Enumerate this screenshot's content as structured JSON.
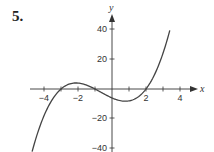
{
  "problem": {
    "number": "5."
  },
  "chart_data": {
    "type": "line",
    "title": "",
    "xlabel": "x",
    "ylabel": "y",
    "xlim": [
      -4.8,
      4.8
    ],
    "ylim": [
      -40,
      45
    ],
    "grid": false,
    "x_ticks": [
      -4,
      -3,
      -2,
      -1,
      1,
      2,
      3,
      4
    ],
    "x_tick_labels": [
      "-4",
      "-2",
      "2",
      "4"
    ],
    "y_ticks": [
      -40,
      -20,
      20,
      40
    ],
    "y_tick_labels": [
      "40",
      "20",
      "-20",
      "-40"
    ],
    "series": [
      {
        "name": "f(x)",
        "expression": "(x+3)(x+1)(x-2)",
        "x": [
          -4.7,
          -4.5,
          -4,
          -3.5,
          -3,
          -2.5,
          -2,
          -1.5,
          -1,
          -0.5,
          0,
          0.5,
          1,
          1.5,
          2,
          2.5,
          3,
          3.4
        ],
        "values": [
          -38.6,
          -31.5,
          -18,
          -8.1,
          0,
          3.4,
          4,
          2.6,
          0,
          -3.1,
          -6,
          -7.9,
          -8,
          -5.6,
          0,
          9.6,
          24,
          38.2
        ]
      }
    ],
    "annotations": []
  },
  "axes": {
    "x_label": "x",
    "y_label": "y",
    "x_tick_labels": [
      "−4",
      "−2",
      "2",
      "4"
    ],
    "y_tick_labels": [
      "40",
      "20",
      "−20",
      "−40"
    ]
  }
}
